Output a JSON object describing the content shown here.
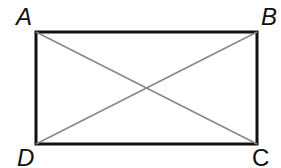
{
  "diagram": {
    "vertices": [
      {
        "label": "A",
        "x": 36,
        "y": 32
      },
      {
        "label": "B",
        "x": 257,
        "y": 32
      },
      {
        "label": "C",
        "x": 257,
        "y": 144
      },
      {
        "label": "D",
        "x": 36,
        "y": 144
      }
    ],
    "diagonals": [
      "AC",
      "BD"
    ],
    "colors": {
      "outline": "#111111",
      "diagonal": "#808080"
    }
  }
}
